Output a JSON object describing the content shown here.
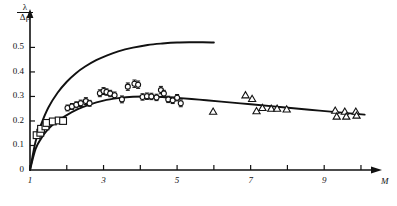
{
  "chart_data": {
    "type": "scatter",
    "title": "",
    "xlabel": "M",
    "ylabel_numerator": "λ",
    "ylabel_denominator": "Δρ",
    "grid": false,
    "legend": "none",
    "xlim": [
      1,
      10.3
    ],
    "ylim": [
      0,
      0.62
    ],
    "xticks": [
      1,
      2,
      3,
      4,
      5,
      6,
      7,
      8,
      9,
      10
    ],
    "xticklabels": [
      "1",
      "",
      "3",
      "",
      "5",
      "",
      "7",
      "",
      "9",
      ""
    ],
    "yticks": [
      0,
      0.1,
      0.2,
      0.3,
      0.4,
      0.5
    ],
    "yticklabels": [
      "0",
      "0.1",
      "0.2",
      "0.3",
      "0.4",
      "0.5"
    ],
    "curves": [
      {
        "name": "upper-theoretical-curve",
        "style": "solid",
        "x": [
          1.0,
          1.15,
          1.3,
          1.5,
          1.75,
          2.0,
          2.25,
          2.5,
          2.8,
          3.1,
          3.4,
          3.8,
          4.2,
          4.6,
          5.0,
          5.4,
          5.7,
          6.0
        ],
        "y": [
          0.0,
          0.115,
          0.185,
          0.255,
          0.315,
          0.36,
          0.395,
          0.422,
          0.448,
          0.468,
          0.484,
          0.499,
          0.51,
          0.516,
          0.52,
          0.521,
          0.521,
          0.52
        ]
      },
      {
        "name": "lower-fitted-curve",
        "style": "solid",
        "x": [
          1.0,
          1.15,
          1.3,
          1.5,
          1.75,
          2.0,
          2.3,
          2.6,
          3.0,
          3.4,
          3.8,
          4.2,
          4.6,
          5.0,
          5.6,
          6.2,
          7.0,
          7.8,
          8.6,
          9.4,
          10.1
        ],
        "y": [
          0.0,
          0.085,
          0.128,
          0.168,
          0.2,
          0.224,
          0.248,
          0.266,
          0.283,
          0.293,
          0.299,
          0.3,
          0.298,
          0.294,
          0.287,
          0.279,
          0.268,
          0.257,
          0.246,
          0.235,
          0.226
        ]
      }
    ],
    "series": [
      {
        "name": "square-markers",
        "marker": "square",
        "points": [
          {
            "x": 1.18,
            "y": 0.142
          },
          {
            "x": 1.28,
            "y": 0.152
          },
          {
            "x": 1.3,
            "y": 0.168
          },
          {
            "x": 1.42,
            "y": 0.178
          },
          {
            "x": 1.45,
            "y": 0.192
          },
          {
            "x": 1.62,
            "y": 0.198
          },
          {
            "x": 1.78,
            "y": 0.202
          },
          {
            "x": 1.9,
            "y": 0.2
          }
        ]
      },
      {
        "name": "circle-markers",
        "marker": "circle",
        "errorbars": true,
        "points": [
          {
            "x": 2.02,
            "y": 0.253,
            "err": 0.012
          },
          {
            "x": 2.14,
            "y": 0.259,
            "err": 0.012
          },
          {
            "x": 2.26,
            "y": 0.266,
            "err": 0.012
          },
          {
            "x": 2.38,
            "y": 0.272,
            "err": 0.013
          },
          {
            "x": 2.52,
            "y": 0.281,
            "err": 0.014
          },
          {
            "x": 2.62,
            "y": 0.272,
            "err": 0.012
          },
          {
            "x": 2.9,
            "y": 0.313,
            "err": 0.014
          },
          {
            "x": 3.0,
            "y": 0.322,
            "err": 0.014
          },
          {
            "x": 3.08,
            "y": 0.318,
            "err": 0.013
          },
          {
            "x": 3.18,
            "y": 0.312,
            "err": 0.013
          },
          {
            "x": 3.3,
            "y": 0.305,
            "err": 0.013
          },
          {
            "x": 3.5,
            "y": 0.288,
            "err": 0.014
          },
          {
            "x": 3.66,
            "y": 0.34,
            "err": 0.015
          },
          {
            "x": 3.84,
            "y": 0.352,
            "err": 0.015
          },
          {
            "x": 3.94,
            "y": 0.348,
            "err": 0.015
          },
          {
            "x": 4.06,
            "y": 0.298,
            "err": 0.013
          },
          {
            "x": 4.18,
            "y": 0.301,
            "err": 0.013
          },
          {
            "x": 4.3,
            "y": 0.3,
            "err": 0.013
          },
          {
            "x": 4.44,
            "y": 0.296,
            "err": 0.013
          },
          {
            "x": 4.56,
            "y": 0.326,
            "err": 0.015
          },
          {
            "x": 4.64,
            "y": 0.312,
            "err": 0.013
          },
          {
            "x": 4.76,
            "y": 0.288,
            "err": 0.013
          },
          {
            "x": 4.88,
            "y": 0.284,
            "err": 0.013
          },
          {
            "x": 5.0,
            "y": 0.295,
            "err": 0.013
          },
          {
            "x": 5.1,
            "y": 0.272,
            "err": 0.014
          }
        ]
      },
      {
        "name": "triangle-markers",
        "marker": "triangle",
        "points": [
          {
            "x": 5.98,
            "y": 0.238
          },
          {
            "x": 6.86,
            "y": 0.305
          },
          {
            "x": 7.04,
            "y": 0.29
          },
          {
            "x": 7.16,
            "y": 0.24
          },
          {
            "x": 7.32,
            "y": 0.253
          },
          {
            "x": 7.56,
            "y": 0.25
          },
          {
            "x": 7.72,
            "y": 0.25
          },
          {
            "x": 7.98,
            "y": 0.247
          },
          {
            "x": 9.3,
            "y": 0.242
          },
          {
            "x": 9.34,
            "y": 0.218
          },
          {
            "x": 9.56,
            "y": 0.238
          },
          {
            "x": 9.6,
            "y": 0.218
          },
          {
            "x": 9.86,
            "y": 0.238
          },
          {
            "x": 9.88,
            "y": 0.222
          }
        ]
      }
    ]
  },
  "axis": {
    "x_name": "M",
    "y_numerator": "λ",
    "y_denominator": "Δρ"
  }
}
